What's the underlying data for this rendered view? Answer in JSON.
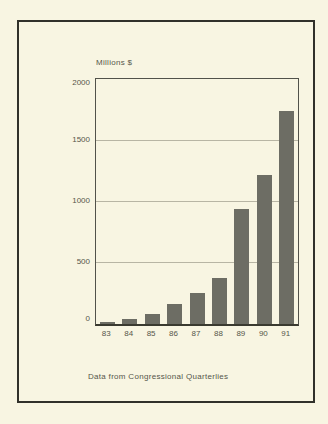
{
  "figure": {
    "caption": "Data from Congressional Quarterlies"
  },
  "chart_data": {
    "type": "bar",
    "title": "Millions $",
    "categories": [
      "83",
      "84",
      "85",
      "86",
      "87",
      "88",
      "89",
      "90",
      "91"
    ],
    "values": [
      15,
      40,
      80,
      160,
      255,
      375,
      940,
      1220,
      1740
    ],
    "xlabel": "",
    "ylabel": "Millions $",
    "ylim": [
      0,
      2000
    ],
    "yticks": [
      0,
      500,
      1000,
      1500,
      2000
    ],
    "grid": true,
    "legend": false,
    "bar_color": "#6d6d64",
    "background_color": "#f8f5e2",
    "frame_color": "#31312a",
    "gridline_color": "#b8b5a4",
    "text_color": "#56564a"
  }
}
